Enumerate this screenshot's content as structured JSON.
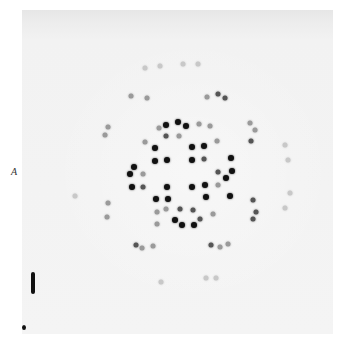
{
  "figure": {
    "panel_label": "A",
    "colors": {
      "background": "#f4f4f4",
      "strong_spot": "#111111",
      "medium_spot": "#555555",
      "weak_spot": "#9a9a9a"
    }
  },
  "spots": [
    {
      "x": 178,
      "y": 122,
      "i": 1
    },
    {
      "x": 186,
      "y": 126,
      "i": 1
    },
    {
      "x": 166,
      "y": 125,
      "i": 1
    },
    {
      "x": 159,
      "y": 128,
      "i": 3
    },
    {
      "x": 199,
      "y": 124,
      "i": 3
    },
    {
      "x": 210,
      "y": 126,
      "i": 3
    },
    {
      "x": 166,
      "y": 136,
      "i": 2
    },
    {
      "x": 179,
      "y": 136,
      "i": 3
    },
    {
      "x": 155,
      "y": 148,
      "i": 1
    },
    {
      "x": 192,
      "y": 147,
      "i": 1
    },
    {
      "x": 204,
      "y": 146,
      "i": 1
    },
    {
      "x": 145,
      "y": 142,
      "i": 3
    },
    {
      "x": 217,
      "y": 141,
      "i": 3
    },
    {
      "x": 155,
      "y": 161,
      "i": 1
    },
    {
      "x": 167,
      "y": 160,
      "i": 1
    },
    {
      "x": 192,
      "y": 160,
      "i": 1
    },
    {
      "x": 204,
      "y": 159,
      "i": 2
    },
    {
      "x": 134,
      "y": 167,
      "i": 1
    },
    {
      "x": 130,
      "y": 174,
      "i": 1
    },
    {
      "x": 231,
      "y": 158,
      "i": 1
    },
    {
      "x": 232,
      "y": 171,
      "i": 1
    },
    {
      "x": 226,
      "y": 178,
      "i": 1
    },
    {
      "x": 132,
      "y": 187,
      "i": 1
    },
    {
      "x": 230,
      "y": 196,
      "i": 1
    },
    {
      "x": 143,
      "y": 174,
      "i": 3
    },
    {
      "x": 143,
      "y": 187,
      "i": 2
    },
    {
      "x": 218,
      "y": 172,
      "i": 2
    },
    {
      "x": 218,
      "y": 185,
      "i": 3
    },
    {
      "x": 167,
      "y": 187,
      "i": 1
    },
    {
      "x": 192,
      "y": 187,
      "i": 1
    },
    {
      "x": 156,
      "y": 199,
      "i": 1
    },
    {
      "x": 168,
      "y": 199,
      "i": 1
    },
    {
      "x": 206,
      "y": 197,
      "i": 1
    },
    {
      "x": 205,
      "y": 185,
      "i": 1
    },
    {
      "x": 180,
      "y": 209,
      "i": 2
    },
    {
      "x": 193,
      "y": 210,
      "i": 2
    },
    {
      "x": 166,
      "y": 209,
      "i": 3
    },
    {
      "x": 175,
      "y": 220,
      "i": 1
    },
    {
      "x": 182,
      "y": 225,
      "i": 1
    },
    {
      "x": 194,
      "y": 225,
      "i": 1
    },
    {
      "x": 200,
      "y": 219,
      "i": 2
    },
    {
      "x": 157,
      "y": 224,
      "i": 3
    },
    {
      "x": 213,
      "y": 214,
      "i": 3
    },
    {
      "x": 157,
      "y": 212,
      "i": 3
    },
    {
      "x": 131,
      "y": 96,
      "i": 3
    },
    {
      "x": 147,
      "y": 98,
      "i": 3
    },
    {
      "x": 207,
      "y": 97,
      "i": 3
    },
    {
      "x": 218,
      "y": 94,
      "i": 2
    },
    {
      "x": 225,
      "y": 98,
      "i": 2
    },
    {
      "x": 108,
      "y": 127,
      "i": 3
    },
    {
      "x": 105,
      "y": 135,
      "i": 3
    },
    {
      "x": 250,
      "y": 123,
      "i": 3
    },
    {
      "x": 255,
      "y": 130,
      "i": 3
    },
    {
      "x": 251,
      "y": 141,
      "i": 2
    },
    {
      "x": 285,
      "y": 145,
      "i": 4
    },
    {
      "x": 288,
      "y": 160,
      "i": 4
    },
    {
      "x": 108,
      "y": 203,
      "i": 3
    },
    {
      "x": 107,
      "y": 217,
      "i": 3
    },
    {
      "x": 253,
      "y": 200,
      "i": 2
    },
    {
      "x": 256,
      "y": 212,
      "i": 2
    },
    {
      "x": 253,
      "y": 219,
      "i": 2
    },
    {
      "x": 290,
      "y": 193,
      "i": 4
    },
    {
      "x": 136,
      "y": 245,
      "i": 2
    },
    {
      "x": 142,
      "y": 248,
      "i": 3
    },
    {
      "x": 153,
      "y": 246,
      "i": 3
    },
    {
      "x": 211,
      "y": 245,
      "i": 2
    },
    {
      "x": 220,
      "y": 247,
      "i": 3
    },
    {
      "x": 228,
      "y": 244,
      "i": 3
    },
    {
      "x": 161,
      "y": 282,
      "i": 4
    },
    {
      "x": 206,
      "y": 278,
      "i": 4
    },
    {
      "x": 216,
      "y": 278,
      "i": 4
    },
    {
      "x": 145,
      "y": 68,
      "i": 4
    },
    {
      "x": 160,
      "y": 66,
      "i": 4
    },
    {
      "x": 183,
      "y": 64,
      "i": 4
    },
    {
      "x": 198,
      "y": 64,
      "i": 4
    },
    {
      "x": 75,
      "y": 196,
      "i": 4
    },
    {
      "x": 285,
      "y": 208,
      "i": 4
    }
  ],
  "marks": {
    "bar": true,
    "dot": true
  }
}
